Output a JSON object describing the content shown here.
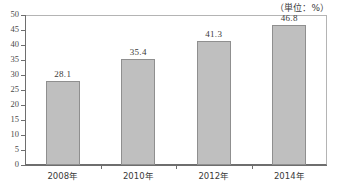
{
  "chart_data": {
    "type": "bar",
    "title": "",
    "subtitle": "",
    "unit_note": "（単位：%）",
    "categories": [
      "2008年",
      "2010年",
      "2012年",
      "2014年"
    ],
    "values": [
      28.1,
      35.4,
      41.3,
      46.8
    ],
    "value_labels": [
      "28.1",
      "35.4",
      "41.3",
      "46.8"
    ],
    "xlabel": "",
    "ylabel": "",
    "ylim": [
      0,
      50
    ],
    "ytick_step": 5,
    "yticks": [
      0,
      5,
      10,
      15,
      20,
      25,
      30,
      35,
      40,
      45,
      50
    ],
    "ytick_labels": [
      "0",
      "5",
      "10",
      "15",
      "20",
      "25",
      "30",
      "35",
      "40",
      "45",
      "50"
    ],
    "grid": false,
    "legend": null,
    "legend_position": "none",
    "series": [
      {
        "name": "",
        "values": [
          28.1,
          35.4,
          41.3,
          46.8
        ]
      }
    ],
    "colors": {
      "bar_fill": "#bfbfbf",
      "bar_stroke": "#8f8f8f",
      "axis": "#6e6e6e",
      "frame": "#b4b4b4",
      "text": "#3a3a3a",
      "background": "#ffffff"
    }
  }
}
